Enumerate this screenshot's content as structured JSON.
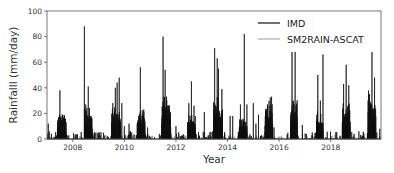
{
  "chart_data": {
    "type": "line",
    "title": "",
    "xlabel": "Year",
    "ylabel": "Rainfalll (mm/day)",
    "xlim": [
      2007.0,
      2019.95
    ],
    "ylim": [
      0,
      100
    ],
    "xticks": [
      2008,
      2010,
      2012,
      2014,
      2016,
      2018
    ],
    "xtick_labels": [
      "2008",
      "2010",
      "2012",
      "2014",
      "2016",
      "2018"
    ],
    "yticks": [
      0,
      20,
      40,
      60,
      80,
      100
    ],
    "ytick_labels": [
      "0",
      "20",
      "40",
      "60",
      "80",
      "100"
    ],
    "grid": false,
    "legend_position": "upper right",
    "series": [
      {
        "name": "IMD",
        "color": "#111111",
        "line_width": 1.0,
        "peaks": [
          [
            2007.05,
            12
          ],
          [
            2007.45,
            17
          ],
          [
            2007.5,
            38
          ],
          [
            2007.6,
            17
          ],
          [
            2007.7,
            16
          ],
          [
            2008.45,
            88
          ],
          [
            2008.5,
            27
          ],
          [
            2008.6,
            41
          ],
          [
            2008.7,
            18
          ],
          [
            2009.55,
            28
          ],
          [
            2009.65,
            40
          ],
          [
            2009.72,
            44
          ],
          [
            2009.8,
            48
          ],
          [
            2009.9,
            28
          ],
          [
            2010.0,
            10
          ],
          [
            2010.18,
            12
          ],
          [
            2010.55,
            18
          ],
          [
            2010.62,
            56
          ],
          [
            2010.75,
            23
          ],
          [
            2010.9,
            9
          ],
          [
            2011.5,
            80
          ],
          [
            2011.58,
            54
          ],
          [
            2011.75,
            26
          ],
          [
            2012.0,
            10
          ],
          [
            2012.5,
            28
          ],
          [
            2012.6,
            45
          ],
          [
            2012.7,
            26
          ],
          [
            2013.1,
            21
          ],
          [
            2013.5,
            71
          ],
          [
            2013.6,
            63
          ],
          [
            2013.65,
            55
          ],
          [
            2013.78,
            39
          ],
          [
            2014.1,
            18
          ],
          [
            2014.2,
            18
          ],
          [
            2014.5,
            27
          ],
          [
            2014.65,
            82
          ],
          [
            2014.75,
            27
          ],
          [
            2015.0,
            28
          ],
          [
            2015.1,
            12
          ],
          [
            2015.2,
            19
          ],
          [
            2015.55,
            27
          ],
          [
            2015.65,
            26
          ],
          [
            2015.8,
            9
          ],
          [
            2016.5,
            68
          ],
          [
            2016.55,
            30
          ],
          [
            2016.62,
            68
          ],
          [
            2016.9,
            11
          ],
          [
            2017.5,
            50
          ],
          [
            2017.6,
            30
          ],
          [
            2017.7,
            66
          ],
          [
            2018.5,
            43
          ],
          [
            2018.6,
            58
          ],
          [
            2018.7,
            42
          ],
          [
            2019.45,
            30
          ],
          [
            2019.6,
            68
          ],
          [
            2019.7,
            48
          ],
          [
            2019.9,
            8
          ]
        ]
      },
      {
        "name": "SM2RAIN-ASCAT",
        "color": "#9a9a9a",
        "line_width": 0.8,
        "peaks": [
          [
            2007.5,
            15
          ],
          [
            2008.5,
            22
          ],
          [
            2009.7,
            20
          ],
          [
            2010.6,
            16
          ],
          [
            2011.55,
            22
          ],
          [
            2012.6,
            18
          ],
          [
            2013.6,
            22
          ],
          [
            2014.6,
            16
          ],
          [
            2015.6,
            18
          ],
          [
            2016.6,
            20
          ],
          [
            2017.6,
            16
          ],
          [
            2018.6,
            18
          ],
          [
            2019.6,
            20
          ]
        ]
      }
    ],
    "monsoon_clusters": [
      {
        "start": 2007.4,
        "end": 2007.75,
        "level": 17
      },
      {
        "start": 2008.45,
        "end": 2008.75,
        "level": 18
      },
      {
        "start": 2009.5,
        "end": 2009.85,
        "level": 20
      },
      {
        "start": 2010.5,
        "end": 2010.8,
        "level": 18
      },
      {
        "start": 2011.45,
        "end": 2011.8,
        "level": 24
      },
      {
        "start": 2012.45,
        "end": 2012.75,
        "level": 14
      },
      {
        "start": 2013.45,
        "end": 2013.8,
        "level": 24
      },
      {
        "start": 2014.45,
        "end": 2014.75,
        "level": 12
      },
      {
        "start": 2015.45,
        "end": 2015.75,
        "level": 24
      },
      {
        "start": 2016.45,
        "end": 2016.7,
        "level": 22
      },
      {
        "start": 2017.45,
        "end": 2017.7,
        "level": 16
      },
      {
        "start": 2018.45,
        "end": 2018.75,
        "level": 20
      },
      {
        "start": 2019.45,
        "end": 2019.75,
        "level": 28
      }
    ]
  },
  "legend": {
    "items": [
      {
        "label": "IMD",
        "color": "#111111"
      },
      {
        "label": "SM2RAIN-ASCAT",
        "color": "#9a9a9a"
      }
    ]
  },
  "axes": {
    "xlabel": "Year",
    "ylabel": "Rainfalll (mm/day)"
  }
}
